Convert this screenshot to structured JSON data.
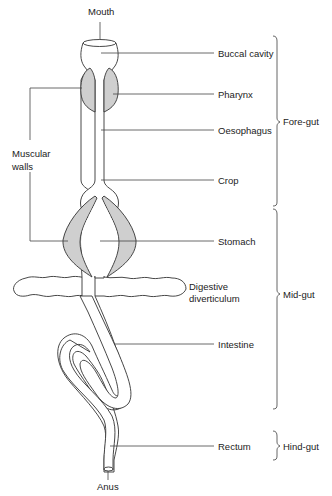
{
  "diagram": {
    "colors": {
      "outline": "#333333",
      "muscle_fill": "#cfcfcf",
      "background": "#ffffff"
    },
    "labels": {
      "mouth": "Mouth",
      "buccal_cavity": "Buccal cavity",
      "pharynx": "Pharynx",
      "oesophagus": "Oesophagus",
      "muscular_walls_line1": "Muscular",
      "muscular_walls_line2": "walls",
      "crop": "Crop",
      "stomach": "Stomach",
      "digestive_line1": "Digestive",
      "digestive_line2": "diverticulum",
      "intestine": "Intestine",
      "rectum": "Rectum",
      "anus": "Anus"
    },
    "regions": {
      "fore_gut": "Fore-gut",
      "mid_gut": "Mid-gut",
      "hind_gut": "Hind-gut"
    }
  }
}
